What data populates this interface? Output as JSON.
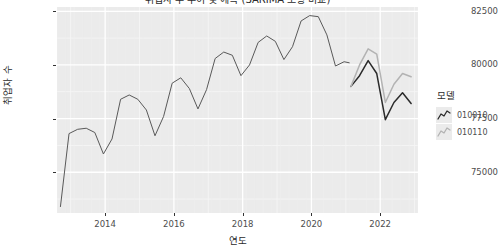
{
  "chart_data": {
    "type": "line",
    "title": "취업자 수 추이 및 예측 (SARIMA 모형 비교)",
    "xlabel": "연도",
    "ylabel": "취업자 수",
    "xlim": [
      2012.6,
      2023.1
    ],
    "ylim": [
      73100,
      82700
    ],
    "grid": true,
    "legend_position": "right",
    "legend_title": "모델",
    "y_ticks": [
      75000,
      77500,
      80000,
      82500
    ],
    "y_tick_labels": [
      "75000",
      "77500",
      "80000",
      "82500"
    ],
    "x_ticks": [
      2014,
      2016,
      2018,
      2020,
      2022
    ],
    "x_tick_labels": [
      "2014",
      "2016",
      "2018",
      "2020",
      "2022"
    ],
    "series": [
      {
        "name": "historical",
        "label": "",
        "color": "#595959",
        "x": [
          2012.7,
          2012.95,
          2013.2,
          2013.45,
          2013.7,
          2013.95,
          2014.2,
          2014.45,
          2014.7,
          2014.95,
          2015.2,
          2015.45,
          2015.7,
          2015.95,
          2016.2,
          2016.45,
          2016.7,
          2016.95,
          2017.2,
          2017.45,
          2017.7,
          2017.95,
          2018.2,
          2018.45,
          2018.7,
          2018.95,
          2019.2,
          2019.45,
          2019.7,
          2019.95,
          2020.2,
          2020.45,
          2020.7,
          2020.95,
          2021.1
        ],
        "values": [
          73400,
          76800,
          77000,
          77050,
          76850,
          75850,
          76550,
          78400,
          78600,
          78400,
          77900,
          76700,
          77600,
          79150,
          79400,
          78900,
          77950,
          78850,
          80300,
          80600,
          80450,
          79500,
          80000,
          81050,
          81350,
          81100,
          80250,
          80850,
          82050,
          82300,
          82250,
          81400,
          79950,
          80150,
          80100
        ]
      },
      {
        "name": "010010",
        "label": "010010",
        "color": "#2b2b2b",
        "x": [
          2021.15,
          2021.4,
          2021.65,
          2021.9,
          2022.15,
          2022.4,
          2022.65,
          2022.9
        ],
        "values": [
          79000,
          79500,
          80200,
          79600,
          77450,
          78250,
          78700,
          78200
        ]
      },
      {
        "name": "010110",
        "label": "010110",
        "color": "#b3b3b3",
        "x": [
          2021.15,
          2021.4,
          2021.65,
          2021.9,
          2022.15,
          2022.4,
          2022.65,
          2022.9
        ],
        "values": [
          79000,
          80000,
          80750,
          80500,
          78250,
          79100,
          79600,
          79450
        ]
      }
    ]
  },
  "axis": {
    "y_title": "취업자 수",
    "x_title": "연도",
    "y_tick_labels": [
      "82500",
      "80000",
      "77500",
      "75000"
    ],
    "x_tick_labels": [
      "2014",
      "2016",
      "2018",
      "2020",
      "2022"
    ]
  },
  "legend": {
    "title": "모델",
    "items": [
      {
        "label": "010010",
        "color": "#2b2b2b"
      },
      {
        "label": "010110",
        "color": "#b3b3b3"
      }
    ]
  },
  "colors": {
    "panel_background": "#ebebeb",
    "major_grid": "#ffffff",
    "minor_grid": "#f5f5f5",
    "historical_line": "#595959",
    "series_010010": "#2b2b2b",
    "series_010110": "#b3b3b3"
  }
}
